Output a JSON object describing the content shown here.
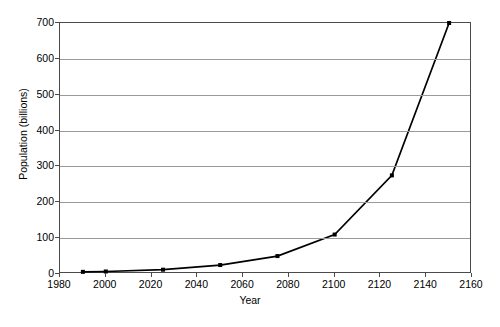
{
  "chart_data": {
    "type": "line",
    "title": "",
    "subtitle": "",
    "xlabel": "Year",
    "ylabel": "Population (billions)",
    "xlim": [
      1980,
      2160
    ],
    "ylim": [
      0,
      700
    ],
    "xticks": [
      1980,
      2000,
      2020,
      2040,
      2060,
      2080,
      2100,
      2120,
      2140,
      2160
    ],
    "yticks": [
      0,
      100,
      200,
      300,
      400,
      500,
      600,
      700
    ],
    "xtick_labels": [
      "1980",
      "2000",
      "2020",
      "2040",
      "2060",
      "2080",
      "2100",
      "2120",
      "2140",
      "2160"
    ],
    "ytick_labels": [
      "0",
      "100",
      "200",
      "300",
      "400",
      "500",
      "600",
      "700"
    ],
    "grid": "horizontal",
    "legend": "none",
    "marker": "square",
    "line_color": "#000000",
    "grid_color": "#9a9a9a",
    "axis_color": "#4a4a4a",
    "background_color": "#ffffff",
    "x": [
      1990,
      2000,
      2025,
      2050,
      2075,
      2100,
      2125,
      2150
    ],
    "values": [
      6,
      7,
      12,
      25,
      50,
      110,
      275,
      700
    ],
    "series": [
      {
        "name": "Population",
        "x": [
          1990,
          2000,
          2025,
          2050,
          2075,
          2100,
          2125,
          2150
        ],
        "values": [
          6,
          7,
          12,
          25,
          50,
          110,
          275,
          700
        ]
      }
    ]
  }
}
